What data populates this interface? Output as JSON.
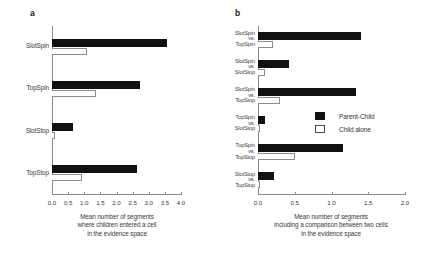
{
  "figure": {
    "panels": [
      {
        "letter": "a"
      },
      {
        "letter": "b"
      }
    ]
  },
  "legend": {
    "position": "center-right of panel b",
    "entries": [
      {
        "label": "Parent-Child",
        "icon": "filled-square-swatch",
        "color": "#111111"
      },
      {
        "label": "Child alone",
        "icon": "open-square-swatch",
        "color": "#ffffff"
      }
    ]
  },
  "chart_data": [
    {
      "type": "bar",
      "orientation": "horizontal",
      "panel": "a",
      "title": "",
      "xlabel": "Mean number of segments where children entered a cell in the evidence space",
      "xlabel_lines": [
        "Mean number of segments",
        "where children entered a cell",
        "in the evidence space"
      ],
      "ylabel": "",
      "categories": [
        "SlotSpin",
        "TopSpin",
        "SlotStop",
        "TopStop"
      ],
      "series": [
        {
          "name": "Parent-Child",
          "color": "#111111",
          "values": [
            3.57,
            2.73,
            0.65,
            2.64
          ]
        },
        {
          "name": "Child alone",
          "color": "#ffffff",
          "values": [
            1.08,
            1.36,
            0.1,
            0.93
          ]
        }
      ],
      "xlim": [
        0.0,
        4.0
      ],
      "xticks": [
        0.0,
        0.5,
        1.0,
        1.5,
        2.0,
        2.5,
        3.0,
        3.5,
        4.0
      ],
      "xticklabels": [
        "0.0",
        "0.5",
        "1.0",
        "1.5",
        "2.0",
        "2.5",
        "3.0",
        "3.5",
        "4.0"
      ],
      "grid": false,
      "legend_position": "none"
    },
    {
      "type": "bar",
      "orientation": "horizontal",
      "panel": "b",
      "title": "",
      "xlabel": "Mean number of segments including a comparison between two cells in the evidence space",
      "xlabel_lines": [
        "Mean number of segments",
        "including a comparison between two cells",
        "in the evidence space"
      ],
      "ylabel": "",
      "categories": [
        "SlotSpin vs. TopSpin",
        "SlotSpin vs. SlotStop",
        "SlotSpin vs. TopStop",
        "TopSpin vs. SlotStop",
        "TopSpin vs. TopStop",
        "SlotStop vs. TopStop"
      ],
      "category_lines": [
        [
          "SlotSpin",
          "vs.",
          "TopSpin"
        ],
        [
          "SlotSpin",
          "vs.",
          "SlotStop"
        ],
        [
          "SlotSpin",
          "vs.",
          "TopStop"
        ],
        [
          "TopSpin",
          "vs.",
          "SlotStop"
        ],
        [
          "TopSpin",
          "vs.",
          "TopStop"
        ],
        [
          "SlotStop",
          "vs.",
          "TopStop"
        ]
      ],
      "series": [
        {
          "name": "Parent-Child",
          "color": "#111111",
          "values": [
            1.4,
            0.42,
            1.33,
            0.1,
            1.15,
            0.22
          ]
        },
        {
          "name": "Child alone",
          "color": "#ffffff",
          "values": [
            0.2,
            0.1,
            0.3,
            0.02,
            0.5,
            0.02
          ]
        }
      ],
      "xlim": [
        0.0,
        2.0
      ],
      "xticks": [
        0.0,
        0.5,
        1.0,
        1.5,
        2.0
      ],
      "xticklabels": [
        "0.0",
        "0.5",
        "1.0",
        "1.5",
        "2.0"
      ],
      "grid": false,
      "legend_position": "inside-right"
    }
  ]
}
